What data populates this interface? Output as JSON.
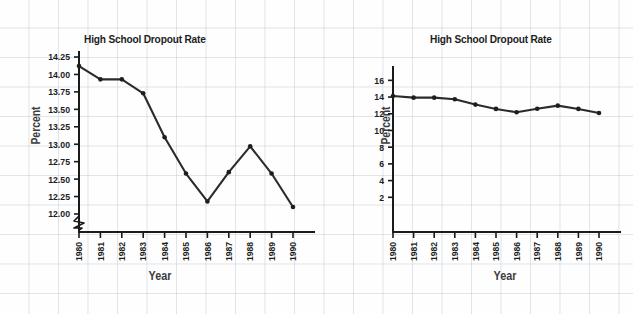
{
  "background": {
    "grid_color": "#afbecd",
    "page_color": "#fefefe"
  },
  "common": {
    "title": "High School Dropout Rate",
    "xlabel": "Year",
    "ylabel": "Percent",
    "line_color": "#2b2b2b",
    "marker_color": "#1e1e1e",
    "axis_color": "#1a1a1a"
  },
  "chart_data": [
    {
      "type": "line",
      "id": "left-truncated-axis",
      "title": "High School Dropout Rate",
      "xlabel": "Year",
      "ylabel": "Percent",
      "categories": [
        "1980",
        "1981",
        "1982",
        "1983",
        "1984",
        "1985",
        "1986",
        "1987",
        "1988",
        "1989",
        "1990"
      ],
      "values": [
        14.12,
        13.93,
        13.93,
        13.73,
        13.1,
        12.58,
        12.18,
        12.6,
        12.97,
        12.58,
        12.1
      ],
      "ylim": [
        12.0,
        14.25
      ],
      "yticks": [
        "12.00",
        "12.25",
        "12.50",
        "12.75",
        "13.00",
        "13.25",
        "13.50",
        "13.75",
        "14.00",
        "14.25"
      ],
      "ytick_values": [
        12.0,
        12.25,
        12.5,
        12.75,
        13.0,
        13.25,
        13.5,
        13.75,
        14.0,
        14.25
      ],
      "axis_break": true,
      "grid": false,
      "legend": "none"
    },
    {
      "type": "line",
      "id": "right-full-axis",
      "title": "High School Dropout Rate",
      "xlabel": "Year",
      "ylabel": "Percent",
      "categories": [
        "1980",
        "1981",
        "1982",
        "1983",
        "1984",
        "1985",
        "1986",
        "1987",
        "1988",
        "1989",
        "1990"
      ],
      "values": [
        14.12,
        13.93,
        13.93,
        13.73,
        13.1,
        12.58,
        12.18,
        12.6,
        12.97,
        12.58,
        12.1
      ],
      "ylim": [
        0,
        17
      ],
      "yticks": [
        "2",
        "4",
        "6",
        "8",
        "10",
        "12",
        "14",
        "16"
      ],
      "ytick_values": [
        2,
        4,
        6,
        8,
        10,
        12,
        14,
        16
      ],
      "axis_break": false,
      "grid": false,
      "legend": "none"
    }
  ]
}
